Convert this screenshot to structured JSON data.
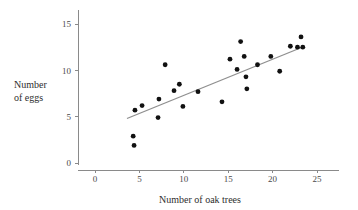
{
  "chart_data": {
    "type": "scatter",
    "title": "",
    "xlabel": "Number of oak trees",
    "ylabel": "Number\nof eggs",
    "ylabel_line1": "Number",
    "ylabel_line2": "of eggs",
    "xlim": [
      0,
      27.5
    ],
    "ylim": [
      0,
      16.5
    ],
    "xticks": [
      0,
      5,
      10,
      15,
      20,
      25
    ],
    "xtick_labels": [
      "0",
      "5",
      "10",
      "15",
      "20",
      "25"
    ],
    "yticks": [
      0,
      5,
      10,
      15
    ],
    "ytick_labels": [
      "0",
      "5",
      "10",
      "15"
    ],
    "grid": false,
    "legend": null,
    "point_color": "#111111",
    "line_color": "#8f8f8f",
    "axis_color": "#8a8a8a",
    "points": [
      {
        "x": 4.3,
        "y": 2.9
      },
      {
        "x": 4.4,
        "y": 1.9
      },
      {
        "x": 4.5,
        "y": 5.7
      },
      {
        "x": 5.3,
        "y": 6.2
      },
      {
        "x": 7.1,
        "y": 4.9
      },
      {
        "x": 7.2,
        "y": 6.9
      },
      {
        "x": 7.9,
        "y": 10.6
      },
      {
        "x": 8.9,
        "y": 7.8
      },
      {
        "x": 9.5,
        "y": 8.5
      },
      {
        "x": 9.9,
        "y": 6.1
      },
      {
        "x": 11.6,
        "y": 7.7
      },
      {
        "x": 14.3,
        "y": 6.6
      },
      {
        "x": 15.2,
        "y": 11.2
      },
      {
        "x": 16.0,
        "y": 10.1
      },
      {
        "x": 16.4,
        "y": 13.1
      },
      {
        "x": 16.8,
        "y": 11.5
      },
      {
        "x": 17.0,
        "y": 9.3
      },
      {
        "x": 17.1,
        "y": 8.0
      },
      {
        "x": 18.3,
        "y": 10.6
      },
      {
        "x": 19.8,
        "y": 11.5
      },
      {
        "x": 20.8,
        "y": 9.9
      },
      {
        "x": 22.0,
        "y": 12.6
      },
      {
        "x": 22.8,
        "y": 12.5
      },
      {
        "x": 23.2,
        "y": 13.6
      },
      {
        "x": 23.4,
        "y": 12.5
      }
    ],
    "fit_line": {
      "x_start": 3.6,
      "y_start": 4.8,
      "x_end": 23.6,
      "y_end": 12.6
    }
  }
}
